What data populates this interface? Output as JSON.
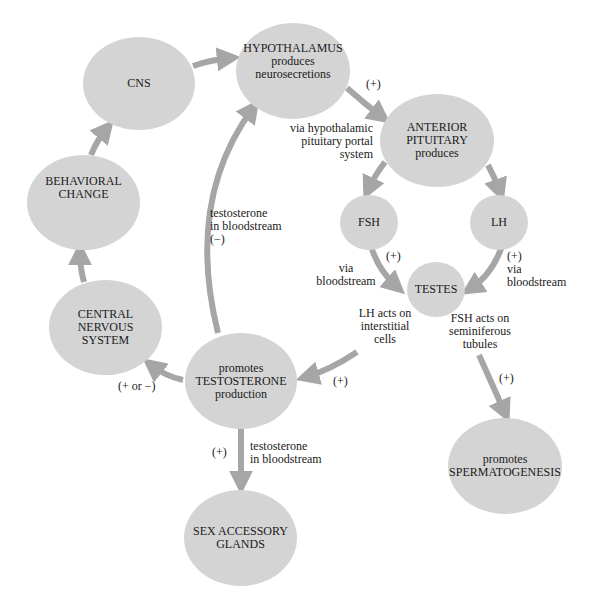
{
  "nodes": {
    "cns": "CNS",
    "hypothalamus": "HYPOTHALAMUS\nproduces\nneurosecretions",
    "anterior_pituitary": "ANTERIOR\nPITUITARY\nproduces",
    "fsh": "FSH",
    "lh": "LH",
    "testes": "TESTES",
    "behavioral_change": "BEHAVIORAL\nCHANGE",
    "central_nervous_system": "CENTRAL NERVOUS\nSYSTEM",
    "testosterone_production": "promotes\nTESTOSTERONE\nproduction",
    "sex_accessory_glands": "SEX ACCESSORY\nGLANDS",
    "spermatogenesis": "promotes\nSPERMATOGENESIS"
  },
  "labels": {
    "hypo_to_pit_sign": "(+)",
    "portal_system": "via hypothalamic\npituitary portal\nsystem",
    "feedback_testosterone": "testosterone\nin bloodstream\n(−)",
    "fsh_sign": "(+)",
    "fsh_via": "via\nbloodstream",
    "lh_via": "(+)\nvia\nbloodstream",
    "lh_acts": "LH acts on\ninterstitial\ncells",
    "fsh_acts": "FSH acts on\nseminiferous\ntubules",
    "testes_to_testosterone_sign": "(+)",
    "to_cns_sign": "(+ or −)",
    "to_glands_sign": "(+)",
    "to_glands_text": "testosterone\nin bloodstream",
    "to_spermatogenesis_sign": "(+)"
  },
  "colors": {
    "node_fill": "#d4d4d4",
    "arrow": "#a6a6a6",
    "text": "#1a1a1a"
  },
  "caption": "Feedback loop (partially visible)"
}
